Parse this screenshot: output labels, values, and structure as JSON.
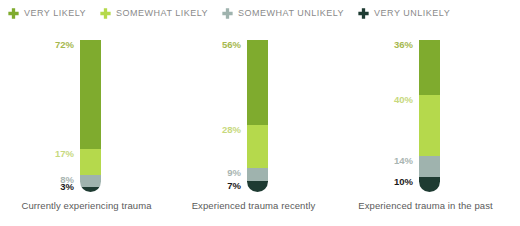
{
  "legend": {
    "items": [
      {
        "label": "VERY LIKELY",
        "icon": "plus-icon",
        "color": "#7FAB2E"
      },
      {
        "label": "SOMEWHAT LIKELY",
        "icon": "plus-icon",
        "color": "#B5D94C"
      },
      {
        "label": "SOMEWHAT UNLIKELY",
        "icon": "plus-icon",
        "color": "#9FB3AE"
      },
      {
        "label": "VERY UNLIKELY",
        "icon": "plus-icon",
        "color": "#1E3B32"
      }
    ]
  },
  "chart_data": {
    "type": "bar",
    "title": "",
    "xlabel": "",
    "ylabel": "",
    "ylim": [
      0,
      100
    ],
    "grid": false,
    "legend_position": "top",
    "stacked": true,
    "orientation": "vertical",
    "categories": [
      "Currently experiencing trauma",
      "Experienced trauma recently",
      "Experienced trauma in the past"
    ],
    "series": [
      {
        "name": "VERY LIKELY",
        "color": "#7FAB2E",
        "values": [
          72,
          56,
          36
        ],
        "labels": [
          "72%",
          "56%",
          "36%"
        ]
      },
      {
        "name": "SOMEWHAT LIKELY",
        "color": "#B5D94C",
        "values": [
          17,
          28,
          40
        ],
        "labels": [
          "17%",
          "28%",
          "40%"
        ]
      },
      {
        "name": "SOMEWHAT UNLIKELY",
        "color": "#9FB3AE",
        "values": [
          8,
          9,
          14
        ],
        "labels": [
          "8%",
          "9%",
          "14%"
        ]
      },
      {
        "name": "VERY UNLIKELY",
        "color": "#1E3B32",
        "values": [
          3,
          7,
          10
        ],
        "labels": [
          "3%",
          "7%",
          "10%"
        ]
      }
    ],
    "label_colors": [
      "#A8B84A",
      "#C4D97A",
      "#A8B3AE",
      "#1A1A1A"
    ]
  },
  "columns": [
    {
      "category": "Currently experiencing trauma",
      "segments": [
        {
          "name": "VERY LIKELY",
          "value": 72,
          "label": "72%",
          "color": "#7FAB2E",
          "label_color": "#A6B84E"
        },
        {
          "name": "SOMEWHAT LIKELY",
          "value": 17,
          "label": "17%",
          "color": "#B5D94C",
          "label_color": "#C7D97E"
        },
        {
          "name": "SOMEWHAT UNLIKELY",
          "value": 8,
          "label": "8%",
          "color": "#9FB3AE",
          "label_color": "#A9B5B2"
        },
        {
          "name": "VERY UNLIKELY",
          "value": 3,
          "label": "3%",
          "color": "#1E3B32",
          "label_color": "#1A1A1A"
        }
      ]
    },
    {
      "category": "Experienced trauma recently",
      "segments": [
        {
          "name": "VERY LIKELY",
          "value": 56,
          "label": "56%",
          "color": "#7FAB2E",
          "label_color": "#A6B84E"
        },
        {
          "name": "SOMEWHAT LIKELY",
          "value": 28,
          "label": "28%",
          "color": "#B5D94C",
          "label_color": "#C7D97E"
        },
        {
          "name": "SOMEWHAT UNLIKELY",
          "value": 9,
          "label": "9%",
          "color": "#9FB3AE",
          "label_color": "#A9B5B2"
        },
        {
          "name": "VERY UNLIKELY",
          "value": 7,
          "label": "7%",
          "color": "#1E3B32",
          "label_color": "#1A1A1A"
        }
      ]
    },
    {
      "category": "Experienced trauma in the past",
      "segments": [
        {
          "name": "VERY LIKELY",
          "value": 36,
          "label": "36%",
          "color": "#7FAB2E",
          "label_color": "#A6B84E"
        },
        {
          "name": "SOMEWHAT LIKELY",
          "value": 40,
          "label": "40%",
          "color": "#B5D94C",
          "label_color": "#C7D97E"
        },
        {
          "name": "SOMEWHAT UNLIKELY",
          "value": 14,
          "label": "14%",
          "color": "#9FB3AE",
          "label_color": "#A9B5B2"
        },
        {
          "name": "VERY UNLIKELY",
          "value": 10,
          "label": "10%",
          "color": "#1E3B32",
          "label_color": "#1A1A1A"
        }
      ]
    }
  ]
}
